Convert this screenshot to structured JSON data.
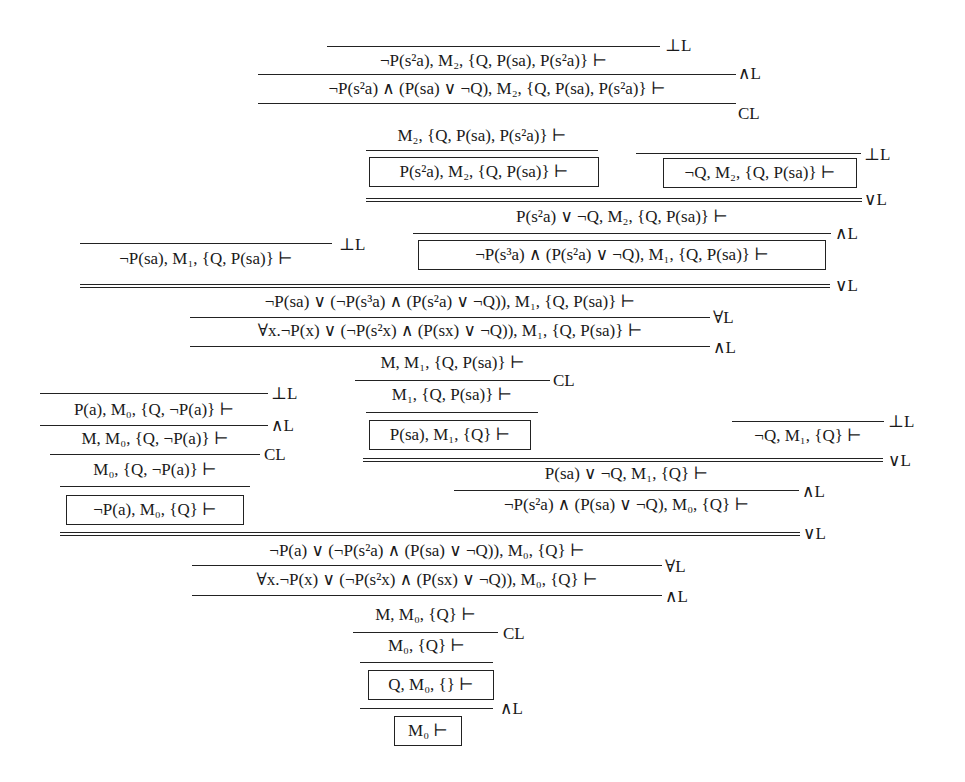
{
  "figure": {
    "nodes": [
      {
        "id": "n1",
        "text": "¬P(s²a), M₂, {Q, P(sa), P(s²a)} ⊢",
        "boxed": false
      },
      {
        "id": "n2",
        "text": "¬P(s²a) ∧ (P(sa) ∨ ¬Q), M₂, {Q, P(sa), P(s²a)} ⊢",
        "boxed": false
      },
      {
        "id": "n3",
        "text": "M₂, {Q, P(sa), P(s²a)} ⊢",
        "boxed": false
      },
      {
        "id": "n4",
        "text": "P(s²a), M₂, {Q, P(sa)} ⊢",
        "boxed": true
      },
      {
        "id": "n5",
        "text": "¬Q, M₂, {Q, P(sa)} ⊢",
        "boxed": true
      },
      {
        "id": "n6",
        "text": "P(s²a) ∨ ¬Q, M₂, {Q, P(sa)} ⊢",
        "boxed": false
      },
      {
        "id": "n7",
        "text": "¬P(sa), M₁, {Q, P(sa)} ⊢",
        "boxed": false
      },
      {
        "id": "n8",
        "text": "¬P(s³a) ∧ (P(s²a) ∨ ¬Q), M₁, {Q, P(sa)} ⊢",
        "boxed": true
      },
      {
        "id": "n9",
        "text": "¬P(sa) ∨ (¬P(s³a) ∧ (P(s²a) ∨ ¬Q)), M₁, {Q, P(sa)} ⊢",
        "boxed": false
      },
      {
        "id": "n10",
        "text": "∀x.¬P(x) ∨ (¬P(s²x) ∧ (P(sx) ∨ ¬Q)), M₁, {Q, P(sa)} ⊢",
        "boxed": false
      },
      {
        "id": "n11",
        "text": "M, M₁, {Q, P(sa)} ⊢",
        "boxed": false
      },
      {
        "id": "n12",
        "text": "M₁, {Q, P(sa)} ⊢",
        "boxed": false
      },
      {
        "id": "n13",
        "text": "P(sa), M₁, {Q} ⊢",
        "boxed": true
      },
      {
        "id": "n14",
        "text": "¬Q, M₁, {Q} ⊢",
        "boxed": false
      },
      {
        "id": "n15",
        "text": "P(sa) ∨ ¬Q, M₁, {Q} ⊢",
        "boxed": false
      },
      {
        "id": "n16",
        "text": "¬P(s²a) ∧ (P(sa) ∨ ¬Q), M₀, {Q} ⊢",
        "boxed": false
      },
      {
        "id": "n17",
        "text": "P(a), M₀, {Q, ¬P(a)} ⊢",
        "boxed": false
      },
      {
        "id": "n18",
        "text": "M, M₀, {Q, ¬P(a)} ⊢",
        "boxed": false
      },
      {
        "id": "n19",
        "text": "M₀, {Q, ¬P(a)} ⊢",
        "boxed": false
      },
      {
        "id": "n20",
        "text": "¬P(a), M₀, {Q} ⊢",
        "boxed": true
      },
      {
        "id": "n21",
        "text": "¬P(a) ∨ (¬P(s²a) ∧ (P(sa) ∨ ¬Q)), M₀, {Q} ⊢",
        "boxed": false
      },
      {
        "id": "n22",
        "text": "∀x.¬P(x) ∨ (¬P(s²x) ∧ (P(sx) ∨ ¬Q)), M₀, {Q} ⊢",
        "boxed": false
      },
      {
        "id": "n23",
        "text": "M, M₀, {Q} ⊢",
        "boxed": false
      },
      {
        "id": "n24",
        "text": "M₀, {Q} ⊢",
        "boxed": false
      },
      {
        "id": "n25",
        "text": "Q, M₀, {} ⊢",
        "boxed": true
      },
      {
        "id": "n26",
        "text": "M₀ ⊢",
        "boxed": true
      }
    ],
    "rule_labels": {
      "bottom_left": "⊥L",
      "and_left": "∧L",
      "or_left": "∨L",
      "forall_left": "∀L",
      "contraction_left": "CL"
    },
    "rules": [
      {
        "label": "⊥L",
        "conclusion": "n1"
      },
      {
        "label": "∧L",
        "premise": "n1",
        "conclusion": "n2"
      },
      {
        "label": "CL",
        "premise": "n2",
        "conclusion": "n3"
      },
      {
        "label": "",
        "premise": "n3",
        "conclusion": "n4"
      },
      {
        "label": "⊥L",
        "conclusion": "n5"
      },
      {
        "label": "∨L",
        "premises": [
          "n4",
          "n5"
        ],
        "conclusion": "n6"
      },
      {
        "label": "∧L",
        "premise": "n6",
        "conclusion": "n8"
      },
      {
        "label": "⊥L",
        "conclusion": "n7"
      },
      {
        "label": "∨L",
        "premises": [
          "n7",
          "n8"
        ],
        "conclusion": "n9"
      },
      {
        "label": "∀L",
        "premise": "n9",
        "conclusion": "n10"
      },
      {
        "label": "∧L",
        "premise": "n10",
        "conclusion": "n11"
      },
      {
        "label": "CL",
        "premise": "n11",
        "conclusion": "n12"
      },
      {
        "label": "",
        "premise": "n12",
        "conclusion": "n13"
      },
      {
        "label": "⊥L",
        "conclusion": "n14"
      },
      {
        "label": "∨L",
        "premises": [
          "n13",
          "n14"
        ],
        "conclusion": "n15"
      },
      {
        "label": "∧L",
        "premise": "n15",
        "conclusion": "n16"
      },
      {
        "label": "⊥L",
        "conclusion": "n17"
      },
      {
        "label": "∧L",
        "premise": "n17",
        "conclusion": "n18"
      },
      {
        "label": "CL",
        "premise": "n18",
        "conclusion": "n19"
      },
      {
        "label": "",
        "premise": "n19",
        "conclusion": "n20"
      },
      {
        "label": "∨L",
        "premises": [
          "n20",
          "n16"
        ],
        "conclusion": "n21"
      },
      {
        "label": "∀L",
        "premise": "n21",
        "conclusion": "n22"
      },
      {
        "label": "∧L",
        "premise": "n22",
        "conclusion": "n23"
      },
      {
        "label": "CL",
        "premise": "n23",
        "conclusion": "n24"
      },
      {
        "label": "",
        "premise": "n24",
        "conclusion": "n25"
      },
      {
        "label": "∧L",
        "premise": "n25",
        "conclusion": "n26"
      }
    ]
  }
}
